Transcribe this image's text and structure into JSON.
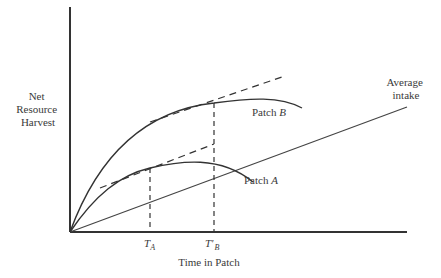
{
  "diagram": {
    "type": "marginal-value-theorem",
    "y_axis_label": [
      "Net",
      "Resource",
      "Harvest"
    ],
    "x_axis_label": "Time in Patch",
    "curves": [
      {
        "name": "Patch B",
        "label_prefix": "Patch ",
        "label_italic": "B",
        "type": "gain-curve"
      },
      {
        "name": "Patch A",
        "label_prefix": "Patch ",
        "label_italic": "A",
        "type": "gain-curve"
      }
    ],
    "average_line": {
      "label": [
        "Average",
        "intake"
      ]
    },
    "x_ticks": [
      {
        "main": "T",
        "sub": "A",
        "note": "optimal leaving time for patch A"
      },
      {
        "main": "T'",
        "sub": "B",
        "note": "optimal leaving time for patch B"
      }
    ],
    "tangents": [
      {
        "curve": "Patch A",
        "style": "dashed"
      },
      {
        "curve": "Patch B",
        "style": "dashed"
      }
    ],
    "colors": {
      "line": "#333333",
      "text": "#3a3a3a",
      "background": "#ffffff"
    }
  }
}
